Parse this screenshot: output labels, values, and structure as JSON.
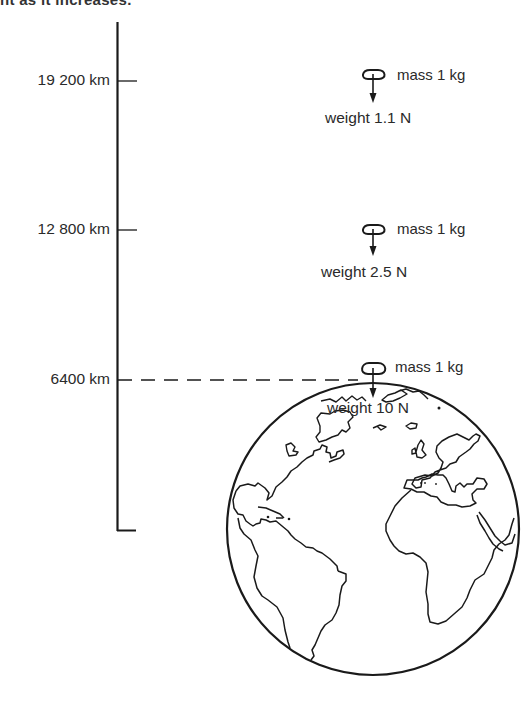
{
  "caption": {
    "partial_text": "ht as it increases."
  },
  "axis": {
    "levels": [
      {
        "altitude": "19 200 km",
        "mass": "mass 1 kg",
        "weight": "weight 1.1 N"
      },
      {
        "altitude": "12 800 km",
        "mass": "mass 1 kg",
        "weight": "weight 2.5 N"
      },
      {
        "altitude": "6400 km",
        "mass": "mass 1 kg",
        "weight": "weight 10 N"
      }
    ]
  },
  "figure": {
    "note": "Weight of a 1 kg mass decreases with distance from Earth's centre",
    "line_color": "#1a1a1a"
  }
}
